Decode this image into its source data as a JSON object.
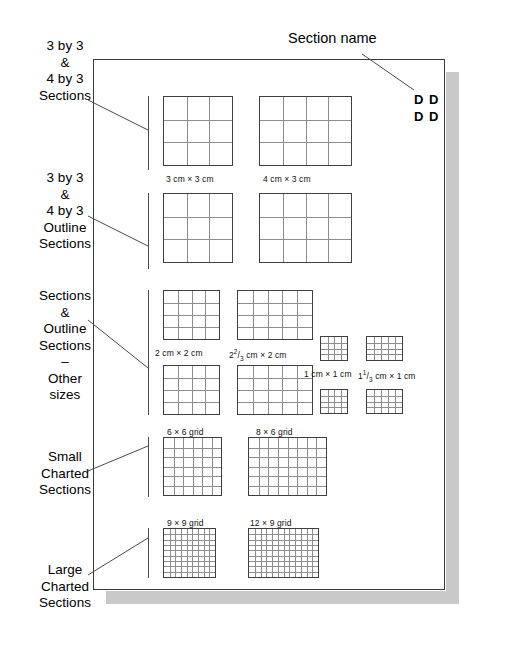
{
  "page": {
    "title": "Section name",
    "dd_marks": [
      "D D",
      "D D"
    ],
    "sheet_color": "#ffffff",
    "sheet_border_color": "#3a3a3a",
    "shadow_color": "#c9c9c9",
    "grid_line_color": "#8d8d8d",
    "grid_border_color": "#3f3f3f"
  },
  "side_labels": [
    {
      "id": "three-by-three-sections",
      "text": "3 by 3\n&\n4 by 3\nSections"
    },
    {
      "id": "three-by-three-outline-sections",
      "text": "3 by 3\n&\n4 by 3\nOutline\nSections"
    },
    {
      "id": "other-sizes",
      "text": "Sections\n&\nOutline\nSections\n–\nOther\nsizes"
    },
    {
      "id": "small-charted-sections",
      "text": "Small\nCharted\nSections"
    },
    {
      "id": "large-charted-sections",
      "text": "Large\nCharted\nSections"
    }
  ],
  "swatches": [
    {
      "id": "sw-3x3",
      "caption": "3 cm × 3 cm",
      "cols": 3,
      "rows": 3
    },
    {
      "id": "sw-4x3",
      "caption": "4 cm × 3 cm",
      "cols": 4,
      "rows": 3
    },
    {
      "id": "sw-3x3-out",
      "caption": "",
      "cols": 3,
      "rows": 3
    },
    {
      "id": "sw-4x3-out",
      "caption": "",
      "cols": 4,
      "rows": 3
    },
    {
      "id": "sw-2x2",
      "caption": "2 cm × 2 cm",
      "cols": 4,
      "rows": 4
    },
    {
      "id": "sw-2_67x2",
      "caption": "2⅔ cm × 2 cm",
      "cols": 5,
      "rows": 4
    },
    {
      "id": "sw-2x2-out",
      "caption": "",
      "cols": 4,
      "rows": 4
    },
    {
      "id": "sw-2_67x2-out",
      "caption": "",
      "cols": 5,
      "rows": 4
    },
    {
      "id": "sw-1x1",
      "caption": "1 cm × 1 cm",
      "cols": 4,
      "rows": 4
    },
    {
      "id": "sw-1_33x1",
      "caption": "1⅓ cm × 1 cm",
      "cols": 5,
      "rows": 4
    },
    {
      "id": "sw-1x1-out",
      "caption": "",
      "cols": 4,
      "rows": 4
    },
    {
      "id": "sw-1_33x1-out",
      "caption": "",
      "cols": 5,
      "rows": 4
    },
    {
      "id": "sw-6x6",
      "caption": "6 × 6 grid",
      "cols": 6,
      "rows": 6
    },
    {
      "id": "sw-8x6",
      "caption": "8 × 6 grid",
      "cols": 8,
      "rows": 6
    },
    {
      "id": "sw-9x9",
      "caption": "9 × 9 grid",
      "cols": 9,
      "rows": 9
    },
    {
      "id": "sw-12x9",
      "caption": "12 × 9 grid",
      "cols": 12,
      "rows": 9
    }
  ],
  "captions": {
    "c_3x3": "3 cm × 3 cm",
    "c_4x3": "4 cm × 3 cm",
    "c_2x2": "2 cm × 2 cm",
    "c_1x1": "1 cm × 1 cm",
    "c_6x6": "6 × 6 grid",
    "c_8x6": "8 × 6 grid",
    "c_9x9": "9 × 9 grid",
    "c_12x9": "12 × 9 grid",
    "c_2_67_pre": "2",
    "c_2_67_num": "2",
    "c_2_67_den": "3",
    "c_2_67_post": " cm × 2 cm",
    "c_1_33_pre": "1",
    "c_1_33_num": "1",
    "c_1_33_den": "3",
    "c_1_33_post": " cm × 1 cm"
  }
}
